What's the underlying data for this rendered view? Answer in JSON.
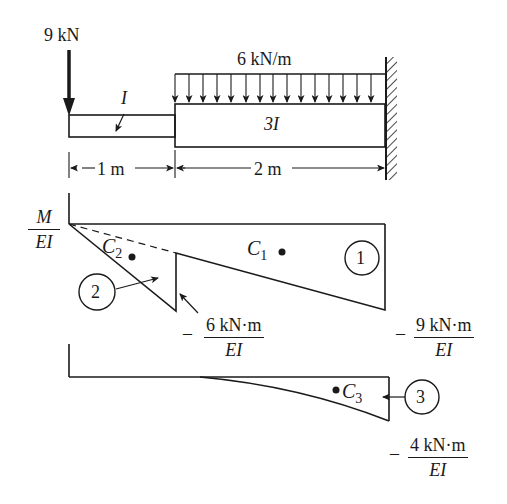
{
  "beam": {
    "point_load": "9 kN",
    "distributed_load": "6 kN/m",
    "segment_left_inertia": "I",
    "segment_right_inertia": "3I",
    "dim_left": "1 m",
    "dim_right": "2 m",
    "support": "fixed-wall"
  },
  "moment_diagram": {
    "axis_label_num": "M",
    "axis_label_den": "EI",
    "centroid_1": "C",
    "centroid_1_sub": "1",
    "centroid_2": "C",
    "centroid_2_sub": "2",
    "region_1": "1",
    "region_2": "2",
    "value_mid_sign": "–",
    "value_mid_num": "6 kN·m",
    "value_mid_den": "EI",
    "value_end_sign": "–",
    "value_end_num": "9 kN·m",
    "value_end_den": "EI"
  },
  "load_diagram": {
    "centroid_3": "C",
    "centroid_3_sub": "3",
    "region_3": "3",
    "value_end_sign": "–",
    "value_end_num": "4 kN·m",
    "value_end_den": "EI"
  },
  "colors": {
    "ink": "#1a1a1a",
    "paper": "#ffffff"
  }
}
